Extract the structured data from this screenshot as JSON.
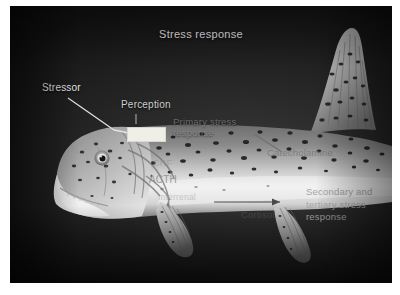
{
  "figure": {
    "type": "annotated-photograph-diagram",
    "palette": {
      "background": "#ffffff",
      "plate_dark": "#141414",
      "label_light": "#eaeaea",
      "label_gray": "#8f8f8f",
      "label_dark_gray": "#4a4a4a",
      "callout_box": "#efefe8",
      "leader_line": "#e2e2e2"
    }
  },
  "title": "Stress response",
  "labels": {
    "stressor": "Stressor",
    "perception": "Perception",
    "primary": "Primary stress\nresponse",
    "crf": "CRF",
    "acth": "ACTH",
    "interrenal": "Interrenal",
    "catecholamine": "Catecholamine",
    "cortisol": "Cortisol",
    "secondary": "Secondary and\ntertiary stress\nresponse"
  },
  "annotations": {
    "callout_box_name": "perception-callout-box",
    "arrow_name": "cortisol-flow-arrow",
    "leader_stressor": "stressor-leader-line",
    "leader_catecholamine": "catecholamine-leader-line"
  }
}
